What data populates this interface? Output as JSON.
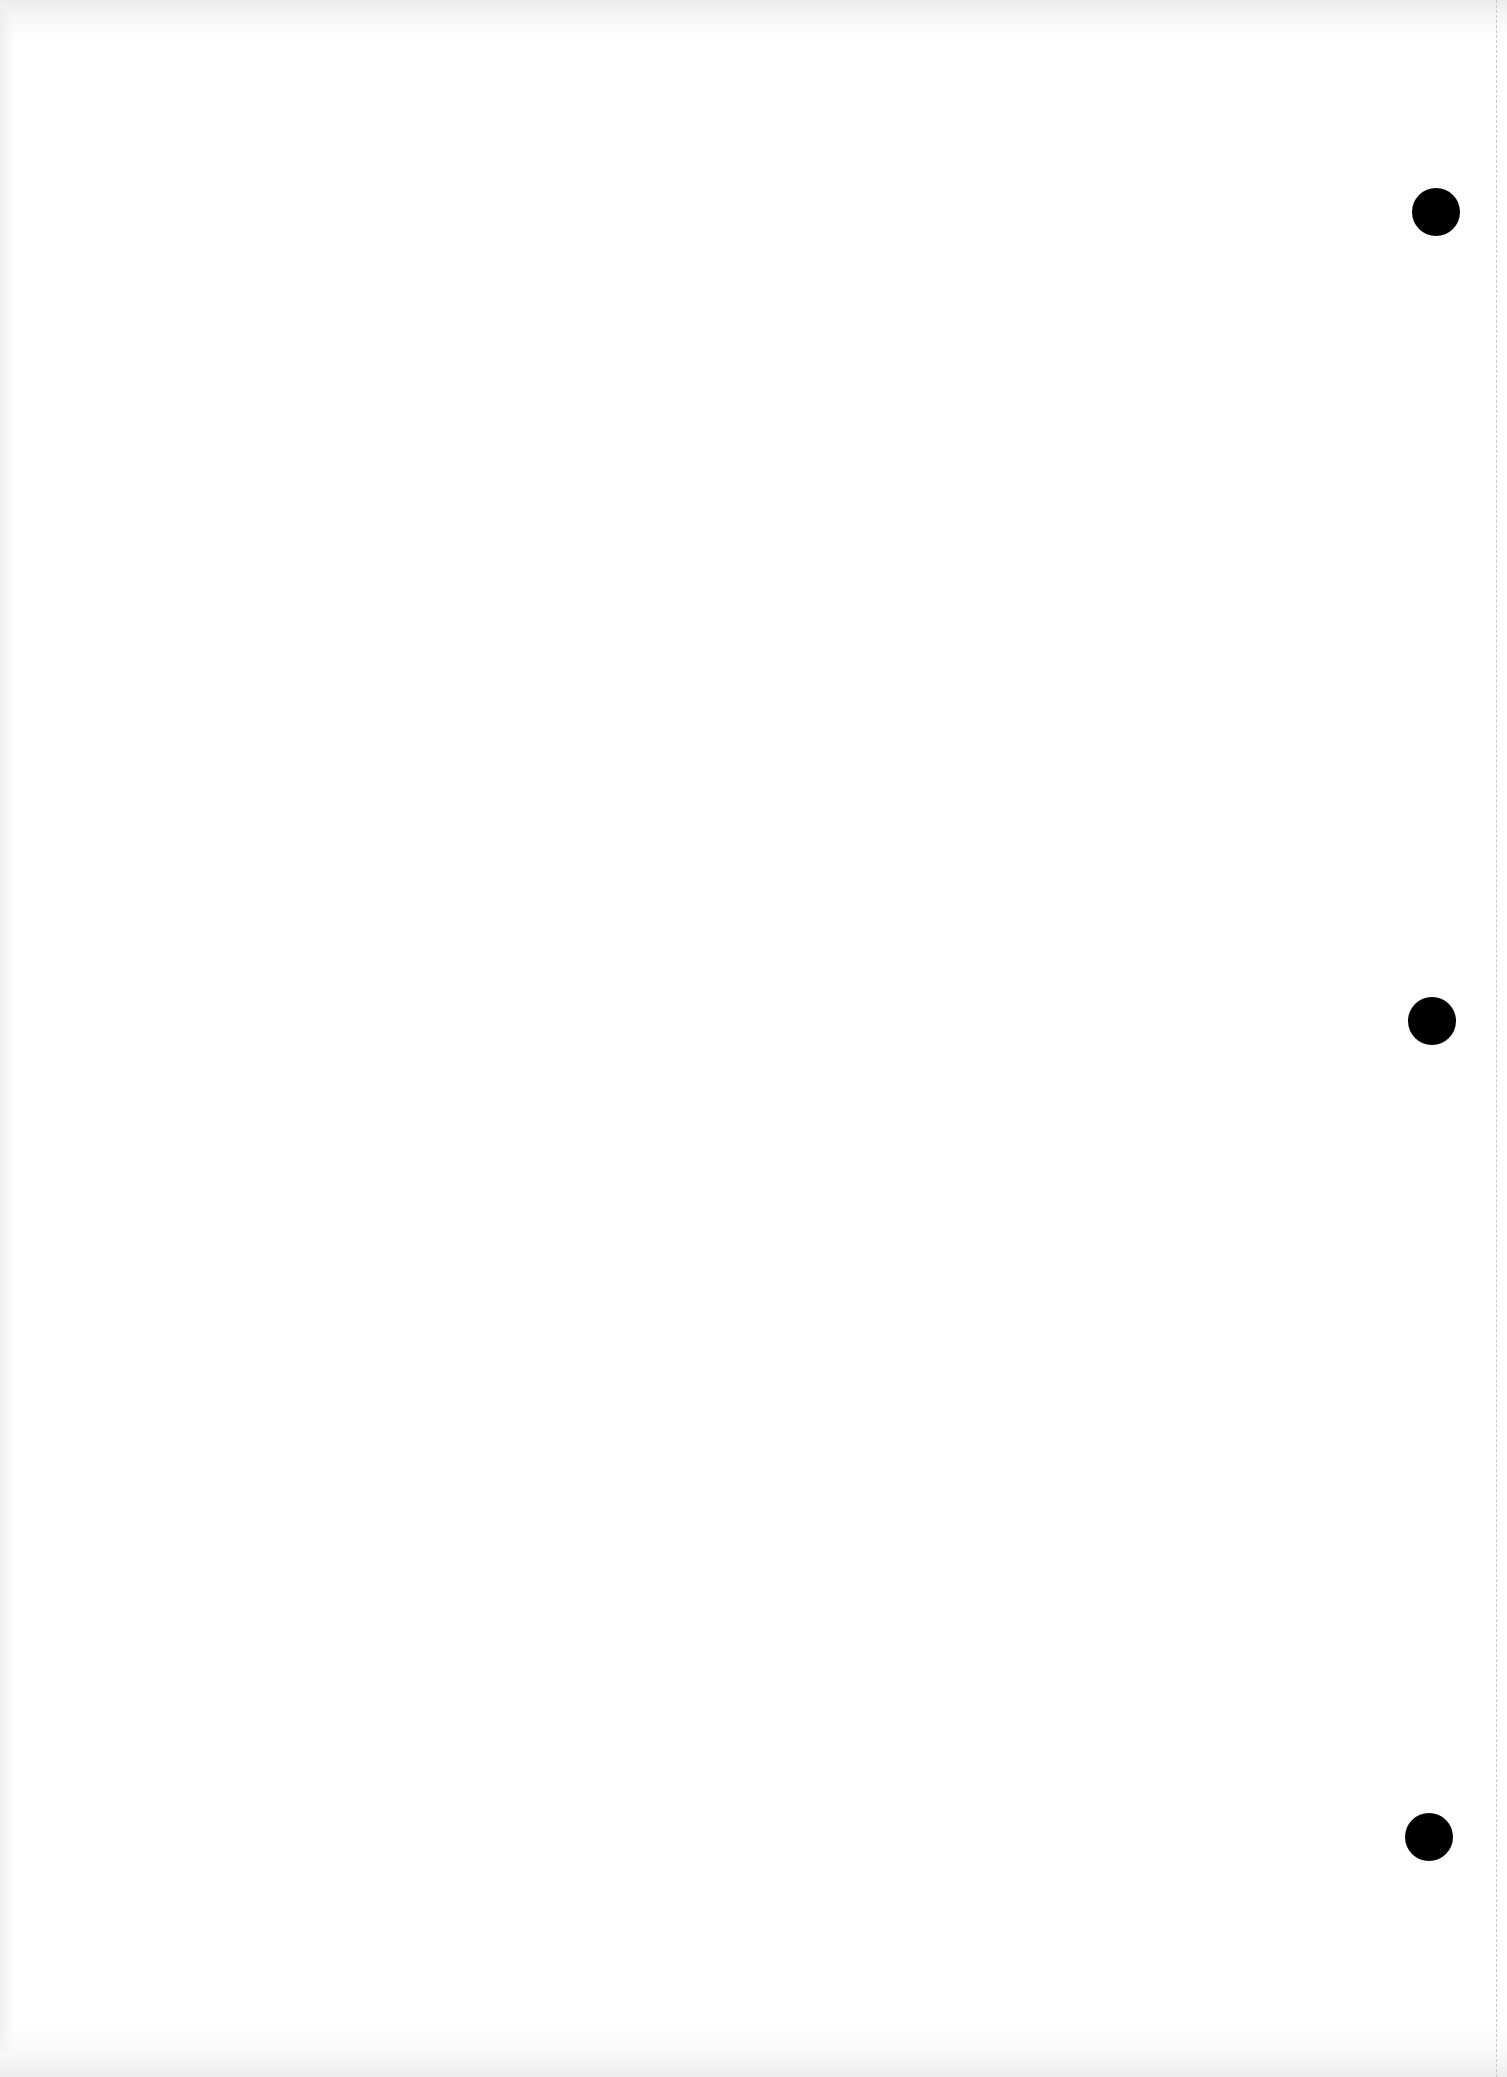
{
  "document": {
    "type": "blank-scanned-page",
    "content_text": "",
    "background_color": "#ffffff",
    "hole_color": "#000000",
    "edge_line_color": "#c9c9c9",
    "edge_line_x": 1496,
    "punch_holes": [
      {
        "cx": 1436,
        "cy": 212,
        "diameter": 48
      },
      {
        "cx": 1432,
        "cy": 1021,
        "diameter": 48
      },
      {
        "cx": 1429,
        "cy": 1837,
        "diameter": 48
      }
    ]
  }
}
